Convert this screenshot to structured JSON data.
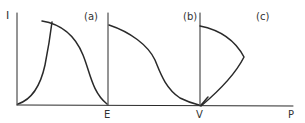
{
  "figure": {
    "y_axis_label": "I",
    "x_axis_label": "P",
    "panels": [
      {
        "id": "a",
        "label": "(a)",
        "x_end_label": "E"
      },
      {
        "id": "b",
        "label": "(b)",
        "x_end_label": "V"
      },
      {
        "id": "c",
        "label": "(c)"
      }
    ]
  }
}
